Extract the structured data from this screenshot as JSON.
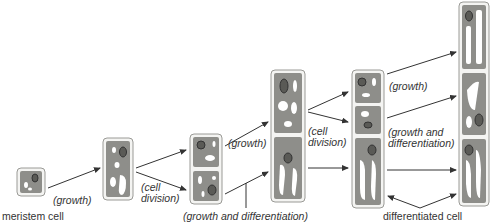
{
  "labels": {
    "meristem": "meristem cell",
    "growth1": "(growth)",
    "celldiv1_a": "(cell",
    "celldiv1_b": "division)",
    "growth2": "(growth)",
    "growth_diff_bottom": "(growth and differentiation)",
    "celldiv2_a": "(cell",
    "celldiv2_b": "division)",
    "growth3": "(growth)",
    "growth_diff_right_a": "(growth and",
    "growth_diff_right_b": "differentiation)",
    "differentiated": "differentiated cell"
  },
  "colors": {
    "cell_wall": "#f4f4f2",
    "cell_wall_border": "#9a9a96",
    "cytoplasm": "#8e8e8a",
    "vacuole": "#ffffff",
    "nucleus": "#5a5a56",
    "arrow": "#333333"
  }
}
